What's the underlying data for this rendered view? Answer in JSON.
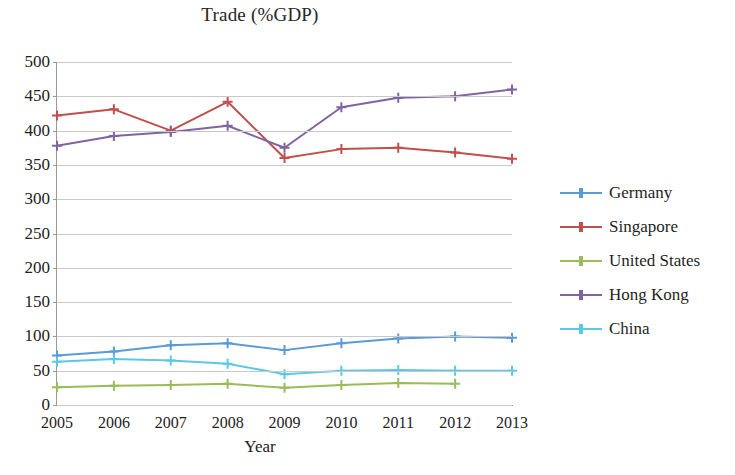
{
  "chart_data": {
    "type": "line",
    "title": "Trade (%GDP)",
    "xlabel": "Year",
    "ylabel": "",
    "x": [
      2005,
      2006,
      2007,
      2008,
      2009,
      2010,
      2011,
      2012,
      2013
    ],
    "categories": [
      "2005",
      "2006",
      "2007",
      "2008",
      "2009",
      "2010",
      "2011",
      "2012",
      "2013"
    ],
    "ylim": [
      0,
      500
    ],
    "yticks": [
      0,
      50,
      100,
      150,
      200,
      250,
      300,
      350,
      400,
      450,
      500
    ],
    "grid": true,
    "legend_position": "right",
    "marker": "plus",
    "series": [
      {
        "name": "Germany",
        "color": "#5B9BD5",
        "values": [
          72,
          78,
          87,
          90,
          80,
          90,
          97,
          100,
          98
        ]
      },
      {
        "name": "Singapore",
        "color": "#C0504D",
        "values": [
          422,
          431,
          400,
          442,
          360,
          373,
          375,
          368,
          359
        ]
      },
      {
        "name": "United States",
        "color": "#9BBB59",
        "values": [
          26,
          28,
          29,
          31,
          25,
          29,
          32,
          31,
          null
        ]
      },
      {
        "name": "Hong Kong",
        "color": "#8064A2",
        "values": [
          378,
          392,
          398,
          407,
          375,
          434,
          448,
          450,
          460
        ]
      },
      {
        "name": "China",
        "color": "#5BC8E8",
        "values": [
          63,
          67,
          65,
          60,
          45,
          50,
          51,
          50,
          50
        ]
      }
    ]
  }
}
